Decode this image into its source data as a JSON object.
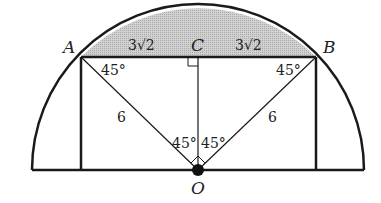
{
  "diagram": {
    "points": {
      "A": "A",
      "B": "B",
      "C": "C",
      "O": "O"
    },
    "segment_labels": {
      "AC": "3√2",
      "CB": "3√2",
      "OA": "6",
      "OB": "6"
    },
    "angles": {
      "OAC": "45°",
      "OBC": "45°",
      "AOC": "45°",
      "BOC": "45°"
    },
    "colors": {
      "stroke": "#1a1a1a",
      "shade": "#c8c8c8"
    }
  }
}
